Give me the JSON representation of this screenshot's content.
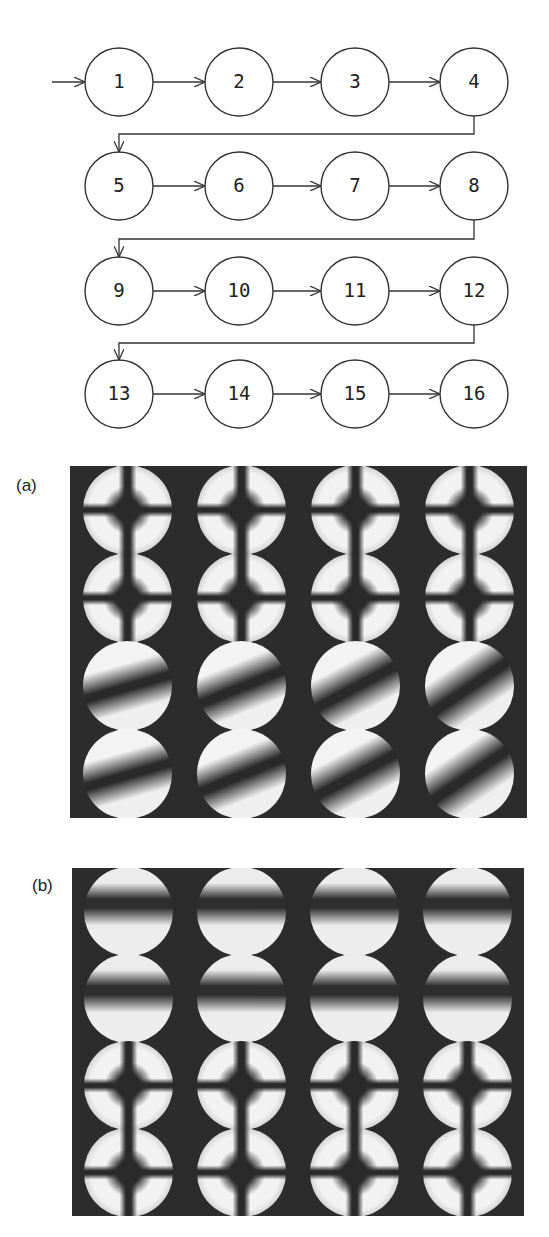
{
  "flow_diagram": {
    "nodes": [
      "1",
      "2",
      "3",
      "4",
      "5",
      "6",
      "7",
      "8",
      "9",
      "10",
      "11",
      "12",
      "13",
      "14",
      "15",
      "16"
    ],
    "layout": {
      "columns_x": [
        119,
        239,
        355,
        474
      ],
      "rows_y": [
        82,
        186,
        291,
        394
      ],
      "radius": 34
    },
    "entry_arrow": true,
    "order": "row-major, each row ends at right and wraps to first column of next row"
  },
  "panels": [
    {
      "label": "(a)",
      "grid": {
        "rows": 4,
        "cols": 4
      },
      "description": "Grid of 16 circular interference (conoscopic) figures, dark cross/isogyre patterns on bright discs"
    },
    {
      "label": "(b)",
      "grid": {
        "rows": 4,
        "cols": 4
      },
      "description": "Grid of 16 circular interference figures, with horizontal dark bands in upper rows and cross patterns in lower rows"
    }
  ]
}
